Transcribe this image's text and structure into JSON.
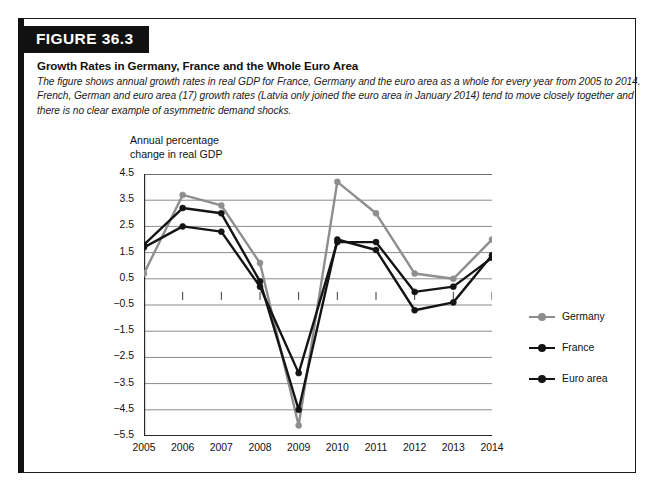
{
  "figure": {
    "banner_label": "FIGURE 36.3",
    "title": "Growth Rates in Germany, France and the Whole Euro Area",
    "caption_lines": [
      "The figure shows annual growth rates in real GDP for France, Germany and the euro area as a whole for every year from 2005 to 2014.",
      "French, German and euro area (17) growth rates (Latvia only joined the euro area in January 2014) tend to move closely together and",
      "there is no clear example of asymmetric demand shocks."
    ]
  },
  "axis_title_lines": [
    "Annual percentage",
    "change in real GDP"
  ],
  "legend": {
    "items": [
      {
        "label": "Germany",
        "color": "#8e8e8e"
      },
      {
        "label": "France",
        "color": "#141414"
      },
      {
        "label": "Euro area",
        "color": "#141414"
      }
    ]
  },
  "chart_data": {
    "type": "line",
    "title": "Growth Rates in Germany, France and the Whole Euro Area",
    "xlabel": "",
    "ylabel": "Annual percentage change in real GDP",
    "categories": [
      "2005",
      "2006",
      "2007",
      "2008",
      "2009",
      "2010",
      "2011",
      "2012",
      "2013",
      "2014"
    ],
    "x": [
      2005,
      2006,
      2007,
      2008,
      2009,
      2010,
      2011,
      2012,
      2013,
      2014
    ],
    "ylim": [
      -5.5,
      4.5
    ],
    "xlim": [
      2005,
      2014
    ],
    "yticks": [
      4.5,
      3.5,
      2.5,
      1.5,
      0.5,
      -0.5,
      -1.5,
      -2.5,
      -3.5,
      -4.5,
      -5.5
    ],
    "ytick_labels": [
      "4.5",
      "3.5",
      "2.5",
      "1.5",
      "0.5",
      "-0.5",
      "-1.5",
      "-2.5",
      "-3.5",
      "-4.5",
      "-5.5"
    ],
    "grid": true,
    "legend_position": "right",
    "markers": "circle",
    "series": [
      {
        "name": "Germany",
        "color": "#8e8e8e",
        "values": [
          0.7,
          3.7,
          3.3,
          1.1,
          -5.1,
          4.2,
          3.0,
          0.7,
          0.5,
          2.0
        ]
      },
      {
        "name": "France",
        "color": "#141414",
        "values": [
          1.7,
          2.5,
          2.3,
          0.2,
          -3.1,
          1.9,
          1.9,
          0.0,
          0.2,
          1.3
        ]
      },
      {
        "name": "Euro area",
        "color": "#141414",
        "values": [
          1.8,
          3.2,
          3.0,
          0.4,
          -4.5,
          2.0,
          1.6,
          -0.7,
          -0.4,
          1.4
        ]
      }
    ]
  }
}
